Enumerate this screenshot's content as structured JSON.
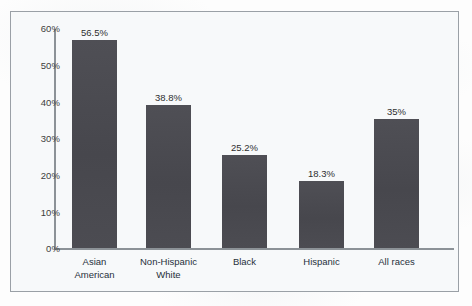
{
  "chart_data": {
    "type": "bar",
    "title": "",
    "subtitle": "",
    "xlabel": "",
    "ylabel": "",
    "categories": [
      "Asian American",
      "Non-Hispanic White",
      "Black",
      "Hispanic",
      "All races"
    ],
    "category_lines": [
      [
        "Asian",
        "American"
      ],
      [
        "Non-Hispanic",
        "White"
      ],
      [
        "Black"
      ],
      [
        "Hispanic"
      ],
      [
        "All races"
      ]
    ],
    "values": [
      56.5,
      38.8,
      25.2,
      18.3,
      35
    ],
    "value_labels": [
      "56.5%",
      "38.8%",
      "25.2%",
      "18.3%",
      "35%"
    ],
    "ylim": [
      0,
      60
    ],
    "ytick_values": [
      60,
      50,
      40,
      30,
      20,
      10,
      0
    ],
    "ytick_labels": [
      "60%",
      "50%",
      "40%",
      "30%",
      "20%",
      "10%",
      "0%"
    ],
    "grid": false,
    "legend": null,
    "legend_position": "none",
    "bar_color": "#4b4b51",
    "axis_color": "#8c9297",
    "plot_background": "#f7f9fa",
    "frame_border_color": "#9aa0a6"
  }
}
